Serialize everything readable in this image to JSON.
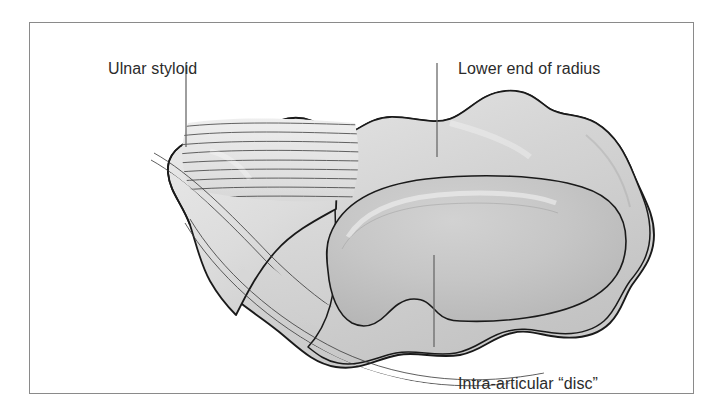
{
  "figure": {
    "kind": "anatomical-illustration",
    "frame": {
      "border_color": "#8a8a8a",
      "background": "#ffffff",
      "x": 29,
      "y": 22,
      "width": 665,
      "height": 372
    },
    "palette": {
      "outline": "#1a1a1a",
      "rim_fill": "#d8d8d8",
      "bone_fill": "#d2d2d2",
      "disc_fill": "#c4c4c4",
      "disc_shade": "#b8b8b8",
      "fiber_line": "#3a3a3a",
      "label_text": "#2b2b2b",
      "leader_line": "#6a6a6a"
    },
    "labels": [
      {
        "id": "ulnar-styloid",
        "text": "Ulnar styloid",
        "text_x": 78,
        "text_y": 37,
        "leader": {
          "x1": 185,
          "y1": 62,
          "x2": 185,
          "y2": 146
        }
      },
      {
        "id": "lower-end-of-radius",
        "text": "Lower end of radius",
        "text_x": 428,
        "text_y": 37,
        "leader": {
          "x1": 436,
          "y1": 62,
          "x2": 436,
          "y2": 156
        }
      },
      {
        "id": "intra-articular-disc",
        "text": "Intra-articular “disc”",
        "text_x": 428,
        "text_y": 352,
        "leader": {
          "x1": 433,
          "y1": 254,
          "x2": 433,
          "y2": 346
        }
      }
    ],
    "regions": [
      {
        "id": "ulnar-styloid-lobe",
        "description": "rounded lobe at left with notch on lateral margin"
      },
      {
        "id": "radius-articular-surface",
        "description": "broad smooth surface filling right half"
      },
      {
        "id": "intra-articular-disc",
        "description": "large oval fibrocartilage disc in centre-right"
      },
      {
        "id": "fibrous-striations-upper",
        "description": "horizontal parallel fibres fanning right from styloid"
      },
      {
        "id": "fibrous-striations-lower",
        "description": "curved parallel fibres along inferior margin"
      },
      {
        "id": "fibrous-striations-oblique",
        "description": "oblique fibre bundle running down-right from styloid notch"
      }
    ]
  }
}
